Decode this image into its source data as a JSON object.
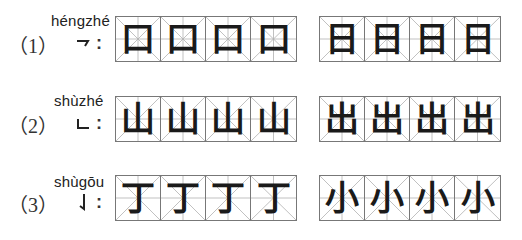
{
  "exercise": {
    "rows": [
      {
        "number": "（1）",
        "pinyin": "héngzhé",
        "stroke_icon": "hengzhe-stroke-icon",
        "colon": ":",
        "groups": [
          {
            "chars": [
              "口",
              "口",
              "口",
              "口"
            ]
          },
          {
            "chars": [
              "日",
              "日",
              "日",
              "日"
            ]
          }
        ]
      },
      {
        "number": "（2）",
        "pinyin": "shùzhé",
        "stroke_icon": "shuzhe-stroke-icon",
        "colon": ":",
        "groups": [
          {
            "chars": [
              "山",
              "山",
              "山",
              "山"
            ]
          },
          {
            "chars": [
              "出",
              "出",
              "出",
              "出"
            ]
          }
        ]
      },
      {
        "number": "（3）",
        "pinyin": "shùgōu",
        "stroke_icon": "shugou-stroke-icon",
        "colon": ":",
        "groups": [
          {
            "chars": [
              "丁",
              "丁",
              "丁",
              "丁"
            ]
          },
          {
            "chars": [
              "小",
              "小",
              "小",
              "小"
            ]
          }
        ]
      }
    ]
  },
  "colors": {
    "grid_border": "#777777",
    "guide_lines": "#b0b0b0",
    "ink": "#1a1a1a"
  }
}
